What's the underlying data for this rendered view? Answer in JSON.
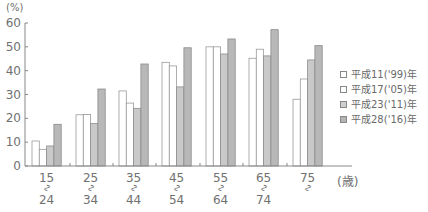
{
  "chart_data": {
    "type": "bar",
    "title": "",
    "xlabel": "(歳)",
    "ylabel": "(%)",
    "ylim": [
      0,
      60
    ],
    "yticks": [
      0,
      10,
      20,
      30,
      40,
      50,
      60
    ],
    "grid": false,
    "legend_position": "right",
    "categories": [
      "15～24",
      "25～34",
      "35～44",
      "45～54",
      "55～64",
      "65～74",
      "75～"
    ],
    "category_labels": [
      {
        "top": "15",
        "mid": "～",
        "bottom": "24"
      },
      {
        "top": "25",
        "mid": "～",
        "bottom": "34"
      },
      {
        "top": "35",
        "mid": "～",
        "bottom": "44"
      },
      {
        "top": "45",
        "mid": "～",
        "bottom": "54"
      },
      {
        "top": "55",
        "mid": "～",
        "bottom": "64"
      },
      {
        "top": "65",
        "mid": "～",
        "bottom": "74"
      },
      {
        "top": "75",
        "mid": "～",
        "bottom": ""
      }
    ],
    "series": [
      {
        "name": "平成11('99)年",
        "color": "#ffffff",
        "values": [
          10.5,
          7.0,
          21.5,
          21.6,
          31.5,
          26.4,
          43.5
        ]
      },
      {
        "name": "平成17('05)年",
        "color": "#ffffff",
        "values": [
          7.0,
          21.6,
          26.4,
          42.0,
          50.0,
          49.0,
          36.5
        ]
      },
      {
        "name": "平成23('11)年",
        "color": "#c8c8c8",
        "values": [
          8.4,
          17.8,
          24.2,
          33.2,
          47.0,
          46.2,
          44.5
        ]
      },
      {
        "name": "平成28('16)年",
        "color": "#b9b9b9",
        "values": [
          17.5,
          32.3,
          42.8,
          49.6,
          53.3,
          57.2,
          50.5
        ]
      }
    ]
  },
  "bars": [
    [
      10.5,
      21.5,
      31.5,
      43.5,
      50.0,
      45.2,
      28.0
    ],
    [
      7.0,
      21.6,
      26.4,
      42.0,
      50.0,
      49.0,
      36.5
    ],
    [
      8.4,
      17.8,
      24.2,
      33.2,
      47.0,
      46.2,
      44.5
    ],
    [
      17.5,
      32.3,
      42.8,
      49.6,
      53.3,
      57.2,
      50.5
    ]
  ],
  "axis": {
    "unit": "(%)",
    "x_unit": "(歳)"
  },
  "legend": [
    {
      "label": "平成11('99)年",
      "fill": "#ffffff"
    },
    {
      "label": "平成17('05)年",
      "fill": "#ffffff"
    },
    {
      "label": "平成23('11)年",
      "fill": "#cfcfcf"
    },
    {
      "label": "平成28('16)年",
      "fill": "#b3b3b3"
    }
  ]
}
